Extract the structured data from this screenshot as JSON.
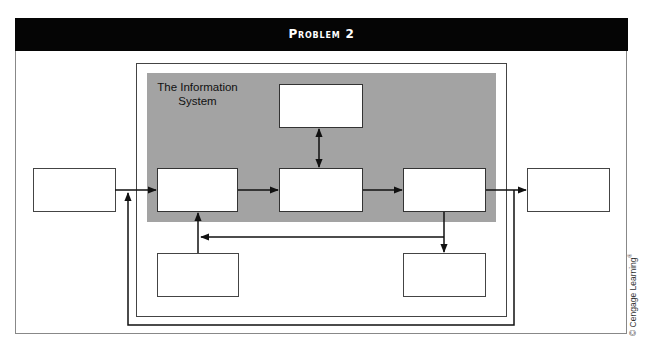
{
  "header": {
    "title": "Problem 2"
  },
  "diagram": {
    "system_label_line1": "The Information",
    "system_label_line2": "System",
    "colors": {
      "header_bg": "#050505",
      "system_fill": "#a3a3a3",
      "box_fill": "#ffffff",
      "line": "#111111"
    },
    "boxes": [
      {
        "id": "environment-input",
        "label": ""
      },
      {
        "id": "input",
        "label": ""
      },
      {
        "id": "processing",
        "label": ""
      },
      {
        "id": "storage-top",
        "label": ""
      },
      {
        "id": "output",
        "label": ""
      },
      {
        "id": "environment-output",
        "label": ""
      },
      {
        "id": "control-input",
        "label": ""
      },
      {
        "id": "control-output",
        "label": ""
      }
    ]
  },
  "copyright": {
    "text": "© Cengage Learning",
    "mark": "®"
  }
}
